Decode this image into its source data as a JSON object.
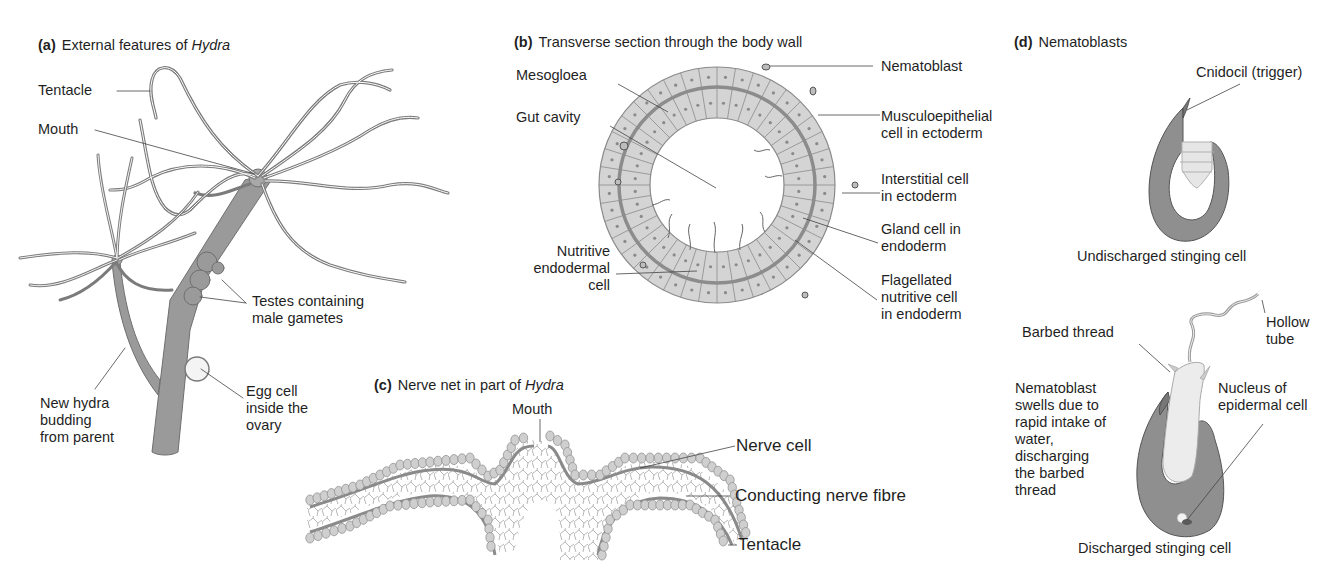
{
  "colors": {
    "tissue": "#9a9a9a",
    "tissue_dark": "#7a7a7a",
    "cell_fill": "#d4d4d4",
    "cell_stroke": "#8a8a8a",
    "mesogloea": "#8c8c8c",
    "leader_line": "#444444",
    "text": "#1f1f1f",
    "background": "#ffffff"
  },
  "panels": {
    "a": {
      "letter": "(a)",
      "title_prefix": "External features of ",
      "title_italic": "Hydra",
      "labels": {
        "tentacle": "Tentacle",
        "mouth": "Mouth",
        "testes": "Testes containing\nmale gametes",
        "egg": "Egg cell\ninside the\novary",
        "bud": "New hydra\nbudding\nfrom parent"
      }
    },
    "b": {
      "letter": "(b)",
      "title": "Transverse section through the body wall",
      "labels": {
        "mesogloea": "Mesogloea",
        "gut_cavity": "Gut cavity",
        "nematoblast": "Nematoblast",
        "musculoepithelial": "Musculoepithelial\ncell in ectoderm",
        "interstitial": "Interstitial cell\nin ectoderm",
        "gland": "Gland cell in\nendoderm",
        "flagellated": "Flagellated\nnutritive cell\nin endoderm",
        "nutritive": "Nutritive\nendodermal\ncell"
      }
    },
    "c": {
      "letter": "(c)",
      "title_prefix": "Nerve net in part of ",
      "title_italic": "Hydra",
      "labels": {
        "mouth": "Mouth",
        "nerve_cell": "Nerve cell",
        "conducting": "Conducting nerve fibre",
        "tentacle": "Tentacle"
      }
    },
    "d": {
      "letter": "(d)",
      "title": "Nematoblasts",
      "labels": {
        "cnidocil": "Cnidocil (trigger)",
        "undischarged": "Undischarged stinging cell",
        "barbed": "Barbed thread",
        "hollow": "Hollow\ntube",
        "swells": "Nematoblast\nswells due to\nrapid intake of\nwater,\ndischarging\nthe barbed\nthread",
        "nucleus": "Nucleus of\nepidermal cell",
        "discharged": "Discharged stinging cell"
      }
    }
  }
}
